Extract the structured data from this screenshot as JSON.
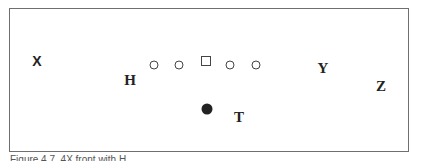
{
  "diagram": {
    "labels": {
      "x": "X",
      "h": "H",
      "y": "Y",
      "z": "Z",
      "t": "T"
    },
    "symbols": {
      "offensive_linemen": [
        "circle",
        "circle",
        "square-center",
        "circle",
        "circle"
      ],
      "ball_carrier": "filled-circle"
    }
  },
  "caption": "Figure 4.7. 4X front with H"
}
